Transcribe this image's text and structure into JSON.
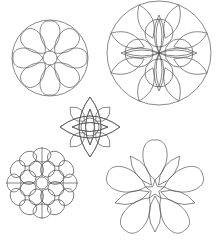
{
  "page": {
    "title": "",
    "background": "#ffffff",
    "line_color": "#555555"
  },
  "figures": [
    {
      "id": "circle-flower-8-petal",
      "cx": 50,
      "cy": 58,
      "r": 38,
      "petals": 8,
      "center_r": 7
    },
    {
      "id": "circle-mandala-4-loop",
      "cx": 159,
      "cy": 53,
      "r": 52,
      "petals": 8
    },
    {
      "id": "lotus-center",
      "cx": 90,
      "cy": 127,
      "petals": 4
    },
    {
      "id": "dahlia",
      "cx": 42,
      "cy": 183,
      "r": 36,
      "inner_petals": 8,
      "outer_petals": 12
    },
    {
      "id": "five-petal-flower",
      "cx": 155,
      "cy": 190,
      "petals": 5
    }
  ]
}
